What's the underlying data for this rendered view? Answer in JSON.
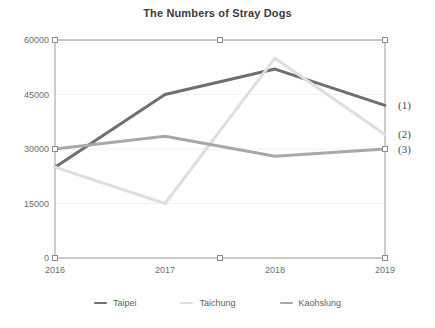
{
  "chart_data": {
    "type": "line",
    "title": "The Numbers of Stray Dogs",
    "xlabel": "",
    "ylabel": "",
    "categories": [
      "2016",
      "2017",
      "2018",
      "2019"
    ],
    "x": [
      2016,
      2017,
      2018,
      2019
    ],
    "ylim": [
      0,
      60000
    ],
    "yticks": [
      0,
      15000,
      30000,
      45000,
      60000
    ],
    "ytick_labels": [
      "0",
      "15000",
      "30000",
      "45000",
      "60000"
    ],
    "xtick_labels": [
      "2016",
      "2017",
      "2018",
      "2019"
    ],
    "grid": true,
    "grid_axis": "y",
    "legend_position": "bottom",
    "series": [
      {
        "name": "Taipei",
        "color": "#6f6f6f",
        "values": [
          25000,
          45000,
          52000,
          42000
        ]
      },
      {
        "name": "Taichung",
        "color": "#dedede",
        "values": [
          25000,
          15000,
          55000,
          34000
        ]
      },
      {
        "name": "Kaohslung",
        "color": "#a8a8a8",
        "values": [
          30000,
          33500,
          28000,
          30000
        ]
      }
    ],
    "annotations": [
      {
        "label": "(1)",
        "value": 42000
      },
      {
        "label": "(2)",
        "value": 34000
      },
      {
        "label": "(3)",
        "value": 30000
      }
    ]
  },
  "style": {
    "axis_color": "#9a9a9a",
    "grid_color": "#f2f2f2",
    "title_color": "#3b3b3b",
    "tick_color": "#6e6e6e",
    "marker_fill": "#ffffff",
    "marker_stroke": "#8c8c8c",
    "background": "#ffffff"
  },
  "legend": {
    "items": [
      {
        "label": "Taipei",
        "color": "#6f6f6f"
      },
      {
        "label": "Taichung",
        "color": "#dedede"
      },
      {
        "label": "Kaohslung",
        "color": "#a8a8a8"
      }
    ]
  }
}
